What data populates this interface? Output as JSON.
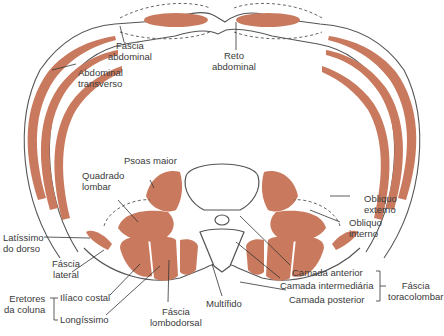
{
  "diagram": {
    "colors": {
      "muscle": "#c97a5e",
      "fascia": "#555555",
      "text": "#3a3a3a",
      "background": "#ffffff"
    },
    "labels": {
      "fascia_abdominal": [
        "Fáscia",
        "abdominal"
      ],
      "reto_abdominal": [
        "Reto",
        "abdominal"
      ],
      "abdominal_transverso": [
        "Abdominal",
        "transverso"
      ],
      "psoas_maior": "Psoas maior",
      "quadrado_lombar": [
        "Quadrado",
        "lombar"
      ],
      "obliquo_externo": [
        "Obliquo",
        "externo"
      ],
      "obliquo_interno": [
        "Obliquo",
        "interno"
      ],
      "latissimo_dorso": [
        "Latíssimo",
        "do dorso"
      ],
      "fascia_lateral": [
        "Fáscia",
        "lateral"
      ],
      "eretores_coluna": [
        "Eretores",
        "da coluna"
      ],
      "iliaco_costal": "Ilíaco costal",
      "longissimo": "Longíssimo",
      "fascia_lombodorsal": [
        "Fáscia",
        "lombodorsal"
      ],
      "multifido": "Multífido",
      "camada_anterior": "Camada anterior",
      "camada_intermediaria": "Camada intermediária",
      "camada_posterior": "Camada posterior",
      "fascia_toracolombar": [
        "Fáscia",
        "toracolombar"
      ]
    }
  }
}
